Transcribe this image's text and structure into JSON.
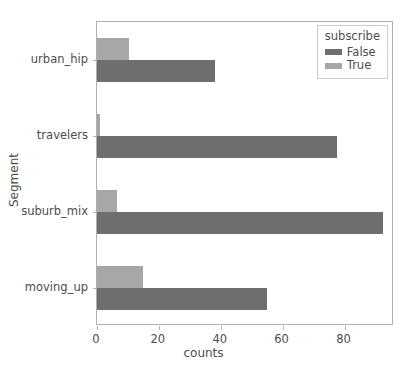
{
  "chart_data": {
    "type": "bar",
    "orientation": "horizontal",
    "title": "",
    "xlabel": "counts",
    "ylabel": "Segment",
    "categories": [
      "urban_hip",
      "travelers",
      "suburb_mix",
      "moving_up"
    ],
    "series": [
      {
        "name": "False",
        "color": "#6e6e6e",
        "values": [
          38,
          77.5,
          92.5,
          55
        ]
      },
      {
        "name": "True",
        "color": "#a7a7a7",
        "values": [
          10.5,
          1,
          6.5,
          15
        ]
      }
    ],
    "legend": {
      "title": "subscribe",
      "position": "upper right",
      "entries": [
        "False",
        "True"
      ]
    },
    "xlim": [
      0,
      96
    ],
    "xticks": [
      0,
      20,
      40,
      60,
      80
    ],
    "xtick_labels": [
      "0",
      "20",
      "40",
      "60",
      "80"
    ],
    "grid": false
  },
  "axes": {
    "x_title": "counts",
    "y_title": "Segment"
  }
}
